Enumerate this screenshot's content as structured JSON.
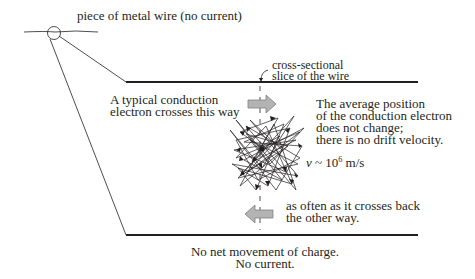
{
  "diagram": {
    "title_label": "piece of metal wire (no current)",
    "slice_label": [
      "cross-sectional",
      "slice of the wire"
    ],
    "left_top_label": [
      "A typical conduction",
      "electron crosses this way"
    ],
    "right_label": [
      "The average position",
      "of the conduction electron",
      "does not change;",
      "there is no drift velocity."
    ],
    "speed_label": {
      "var": "v",
      "approx": "~",
      "base": "10",
      "exp": "6",
      "unit": "m/s"
    },
    "bottom_right_label": [
      "as often as it crosses back",
      "the other way."
    ],
    "caption": [
      "No net movement of charge.",
      "No current."
    ],
    "colors": {
      "line": "#231f20",
      "arrow_fill": "#b3b3b3",
      "arrow_stroke": "#808080"
    }
  }
}
